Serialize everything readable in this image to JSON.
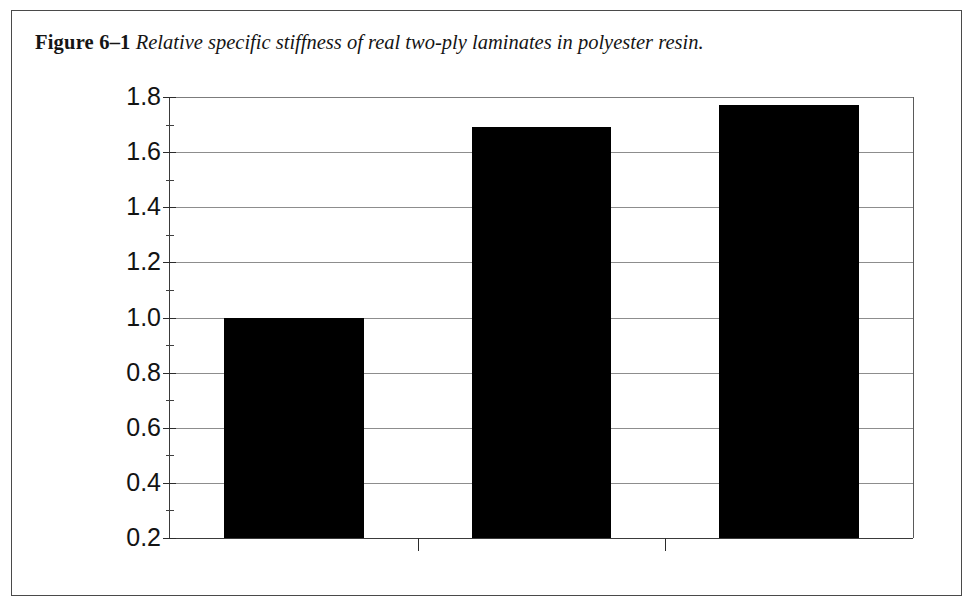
{
  "figure": {
    "label": "Figure 6–1",
    "caption": "Relative specific stiffness of real two-ply laminates in polyester resin."
  },
  "chart_data": {
    "type": "bar",
    "title": "",
    "categories": [
      "CSM",
      "Aramid",
      "Carbon"
    ],
    "values": [
      1.0,
      1.69,
      1.77
    ],
    "series": [
      {
        "name": "Relative specific stiffness",
        "values": [
          1.0,
          1.69,
          1.77
        ]
      }
    ],
    "xlabel": "",
    "ylabel": "Relative specific stiffness, CSM = 1",
    "ylim": [
      0.2,
      1.8
    ],
    "ytick_labels": [
      "1.8",
      "1.6",
      "1.4",
      "1.2",
      "1.0",
      "0.8",
      "0.6",
      "0.4",
      "0.2"
    ],
    "ytick_values": [
      1.8,
      1.6,
      1.4,
      1.2,
      1.0,
      0.8,
      0.6,
      0.4,
      0.2
    ],
    "ytick_minor_values": [
      1.7,
      1.5,
      1.3,
      1.1,
      0.9,
      0.7,
      0.5,
      0.3
    ],
    "grid": true,
    "grid_axis": "y",
    "legend": false,
    "legend_position": "none",
    "bar_color": "#000000",
    "grid_color": "#8d8d8d",
    "axis_color": "#2b2b2b"
  }
}
